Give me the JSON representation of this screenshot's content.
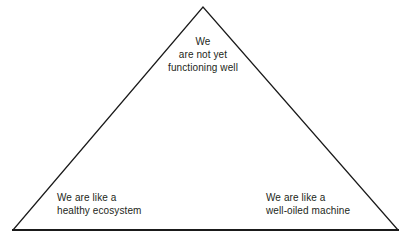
{
  "diagram": {
    "type": "triangle",
    "background_color": "#ffffff",
    "stroke_color": "#1a1a1a",
    "text_color": "#231f20",
    "apex_label": {
      "lines": [
        "We",
        "are not yet",
        "functioning well"
      ],
      "line1": "We",
      "line2": "are not yet",
      "line3": "functioning well"
    },
    "bottom_left_label": {
      "lines": [
        "We are like a",
        "healthy ecosystem"
      ],
      "line1": "We are like a",
      "line2": "healthy ecosystem"
    },
    "bottom_right_label": {
      "lines": [
        "We are like a",
        "well-oiled machine"
      ],
      "line1": "We are like a",
      "line2": "well-oiled machine"
    }
  }
}
